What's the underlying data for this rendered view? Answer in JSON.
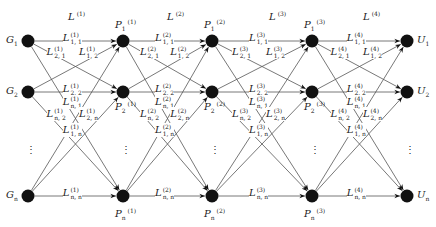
{
  "diagram": {
    "layers": [
      {
        "letter": "L",
        "sup": "(1)",
        "x": 68,
        "y": 10
      },
      {
        "letter": "L",
        "sup": "(2)",
        "x": 167,
        "y": 10
      },
      {
        "letter": "L",
        "sup": "(3)",
        "x": 269,
        "y": 10
      },
      {
        "letter": "L",
        "sup": "(4)",
        "x": 363,
        "y": 10
      }
    ],
    "columns": [
      {
        "id": "G",
        "x": 28,
        "nodes": [
          {
            "letter": "G",
            "sub": "1",
            "sup": "",
            "row": 0
          },
          {
            "letter": "G",
            "sub": "2",
            "sup": "",
            "row": 1
          },
          {
            "letter": "G",
            "sub": "n",
            "sup": "",
            "row": 2
          }
        ],
        "label_side": "left"
      },
      {
        "id": "P1",
        "x": 123,
        "nodes": [
          {
            "letter": "P",
            "sub": "1",
            "sup": "(1)",
            "row": 0
          },
          {
            "letter": "P",
            "sub": "2",
            "sup": "(1)",
            "row": 1
          },
          {
            "letter": "P",
            "sub": "n",
            "sup": "(1)",
            "row": 2
          }
        ],
        "label_side": "pos"
      },
      {
        "id": "P2",
        "x": 212,
        "nodes": [
          {
            "letter": "P",
            "sub": "1",
            "sup": "(2)",
            "row": 0
          },
          {
            "letter": "P",
            "sub": "2",
            "sup": "(2)",
            "row": 1
          },
          {
            "letter": "P",
            "sub": "n",
            "sup": "(2)",
            "row": 2
          }
        ],
        "label_side": "pos"
      },
      {
        "id": "P3",
        "x": 312,
        "nodes": [
          {
            "letter": "P",
            "sub": "1",
            "sup": "(3)",
            "row": 0
          },
          {
            "letter": "P",
            "sub": "2",
            "sup": "(3)",
            "row": 1
          },
          {
            "letter": "P",
            "sub": "n",
            "sup": "(3)",
            "row": 2
          }
        ],
        "label_side": "pos"
      },
      {
        "id": "U",
        "x": 407,
        "nodes": [
          {
            "letter": "U",
            "sub": "1",
            "sup": "",
            "row": 0
          },
          {
            "letter": "U",
            "sub": "2",
            "sup": "",
            "row": 1
          },
          {
            "letter": "U",
            "sub": "n",
            "sup": "",
            "row": 2
          }
        ],
        "label_side": "right"
      }
    ],
    "rows_y": [
      41,
      92,
      196
    ],
    "ellipsis": "⋮",
    "edge_labels_per_layer": [
      {
        "sub": "1, 1",
        "dx": 0.45,
        "row": "top"
      },
      {
        "sub": "2, 1",
        "dx": 0.28,
        "row": "top2"
      },
      {
        "sub": "1, 2",
        "dx": 0.62,
        "row": "top2"
      },
      {
        "sub": "2, 2",
        "dx": 0.45,
        "row": "mid"
      },
      {
        "sub": "n, 1",
        "dx": 0.45,
        "row": "mid2"
      },
      {
        "sub": "n, 2",
        "dx": 0.28,
        "row": "mid3"
      },
      {
        "sub": "2, n",
        "dx": 0.62,
        "row": "mid3"
      },
      {
        "sub": "1, n",
        "dx": 0.45,
        "row": "low"
      },
      {
        "sub": "n, n",
        "dx": 0.45,
        "row": "bot"
      }
    ]
  }
}
